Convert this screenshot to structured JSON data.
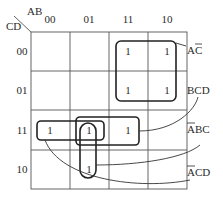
{
  "kmap": {
    "row_var": "CD",
    "col_var": "AB",
    "col_headers": [
      "00",
      "01",
      "11",
      "10"
    ],
    "row_headers": [
      "00",
      "01",
      "11",
      "10"
    ],
    "cells": [
      [
        "",
        "",
        "1",
        "1"
      ],
      [
        "",
        "",
        "1",
        "1"
      ],
      [
        "1",
        "1",
        "1",
        ""
      ],
      [
        "",
        "1",
        "",
        ""
      ]
    ],
    "groups": [
      {
        "term": "AC̄",
        "term_base": "AC",
        "bar_on": "C"
      },
      {
        "term": "BCD",
        "term_base": "BCD",
        "bar_on": ""
      },
      {
        "term": "ĀBC",
        "term_base": "ABC",
        "bar_on": "A"
      },
      {
        "term": "ĀCD",
        "term_base": "ACD",
        "bar_on": "A"
      }
    ]
  },
  "colors": {
    "line": "#222222",
    "grid": "#555555",
    "background": "#ffffff"
  }
}
